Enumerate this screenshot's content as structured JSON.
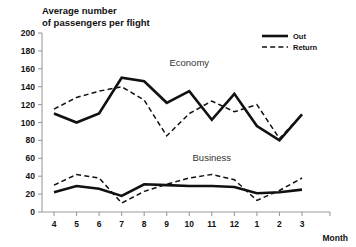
{
  "chart_data": {
    "type": "line",
    "title": "Average number of passengers per flight",
    "title_line1": "Average number",
    "title_line2": "of passengers per flight",
    "xlabel": "Month",
    "ylabel": "",
    "categories": [
      "4",
      "5",
      "6",
      "7",
      "8",
      "9",
      "10",
      "11",
      "12",
      "1",
      "2",
      "3"
    ],
    "ylim": [
      0,
      200
    ],
    "ytick_step": 20,
    "yticks": [
      "0",
      "20",
      "40",
      "60",
      "80",
      "100",
      "120",
      "140",
      "160",
      "180",
      "200"
    ],
    "grid": false,
    "legend_position": "top-right",
    "legend": [
      {
        "name": "Out",
        "style": "solid"
      },
      {
        "name": "Return",
        "style": "dashed"
      }
    ],
    "annotations": [
      {
        "text": "Economy",
        "x_month": "10",
        "y_value": 163
      },
      {
        "text": "Business",
        "x_month": "11",
        "y_value": 57
      }
    ],
    "groups": [
      {
        "name": "Economy",
        "series": [
          {
            "name": "Out",
            "style": "solid",
            "values": [
              110,
              100,
              110,
              150,
              146,
              122,
              135,
              103,
              132,
              96,
              80,
              109
            ]
          },
          {
            "name": "Return",
            "style": "dashed",
            "values": [
              115,
              128,
              135,
              140,
              125,
              85,
              110,
              124,
              112,
              120,
              82,
              109
            ]
          }
        ]
      },
      {
        "name": "Business",
        "series": [
          {
            "name": "Out",
            "style": "solid",
            "values": [
              22,
              29,
              26,
              18,
              31,
              30,
              29,
              29,
              28,
              21,
              22,
              25
            ]
          },
          {
            "name": "Return",
            "style": "dashed",
            "values": [
              30,
              42,
              38,
              10,
              23,
              31,
              38,
              42,
              36,
              13,
              24,
              38
            ]
          }
        ]
      }
    ]
  }
}
